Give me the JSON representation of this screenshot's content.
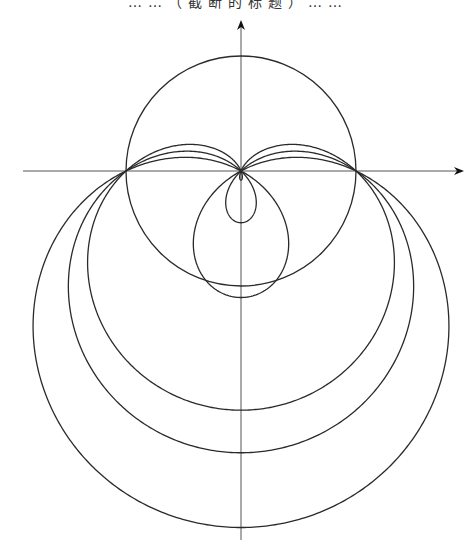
{
  "caption": {
    "text": "……（截断的标题）……",
    "note": "caption text is cut off at the top edge; only glyph bottoms visible"
  },
  "chart_data": {
    "type": "line",
    "xlabel": "",
    "ylabel": "",
    "grid": false,
    "legend": null,
    "axes": {
      "origin_px": [
        241,
        171
      ],
      "x_axis_px": {
        "from": 23,
        "to": 462,
        "arrow": true
      },
      "y_axis_px": {
        "from": 540,
        "to": 22,
        "arrow": true
      }
    },
    "scale_px_per_unit": 115,
    "circle": {
      "center": [
        0,
        0
      ],
      "radius": 1.0
    },
    "series": [
      {
        "name": "limaçon λ=1.08",
        "a": 1.0,
        "lambda": 1.08,
        "bottom_below_origin_px": 239
      },
      {
        "name": "limaçon λ=1.45",
        "a": 1.0,
        "lambda": 1.45,
        "bottom_below_origin_px": 287,
        "inner_loop_px": 48
      },
      {
        "name": "limaçon λ=2.10",
        "a": 1.0,
        "lambda": 2.1,
        "bottom_below_origin_px": 358,
        "inner_loop_px": 120
      }
    ],
    "annotations": {
      "common_points": [
        "origin (0,0)",
        "(-a, 0)",
        "(a, 0)"
      ]
    }
  },
  "colors": {
    "curve": "#2a2a2a",
    "axis": "#555555",
    "background": "#ffffff"
  }
}
